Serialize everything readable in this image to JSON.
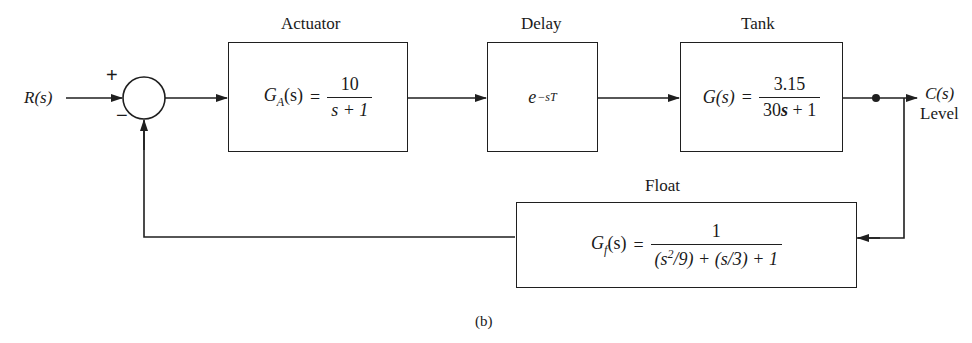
{
  "diagram": {
    "type": "feedback block diagram",
    "caption": "(b)",
    "input": {
      "label": "R(s)"
    },
    "output": {
      "label": "C(s)",
      "sublabel": "Level"
    },
    "summing_junction": {
      "plus_sign": "+",
      "minus_sign": "−"
    },
    "blocks": {
      "actuator": {
        "title": "Actuator",
        "lhs": "G",
        "lhs_sub": "A",
        "lhs_arg": "(s)",
        "equals": "=",
        "numerator": "10",
        "denominator": "s + 1"
      },
      "delay": {
        "title": "Delay",
        "base": "e",
        "exponent": "−sT"
      },
      "tank": {
        "title": "Tank",
        "lhs": "G(s)",
        "equals": "=",
        "numerator": "3.15",
        "den_coef": "30",
        "den_var": "s",
        "den_rest": " + 1"
      },
      "float": {
        "title": "Float",
        "lhs": "G",
        "lhs_sub": "f",
        "lhs_arg": "(s)",
        "equals": "=",
        "numerator": "1",
        "den_part1": "(s",
        "den_sup": "2",
        "den_part2": "/9) + (s/3) + 1"
      }
    },
    "connections": [
      {
        "from": "R(s)",
        "to": "summing_junction",
        "sign": "+"
      },
      {
        "from": "summing_junction",
        "to": "actuator"
      },
      {
        "from": "actuator",
        "to": "delay"
      },
      {
        "from": "delay",
        "to": "tank"
      },
      {
        "from": "tank",
        "to": "C(s)"
      },
      {
        "from": "C(s)",
        "to": "float",
        "note": "pickoff point"
      },
      {
        "from": "float",
        "to": "summing_junction",
        "sign": "−"
      }
    ]
  }
}
